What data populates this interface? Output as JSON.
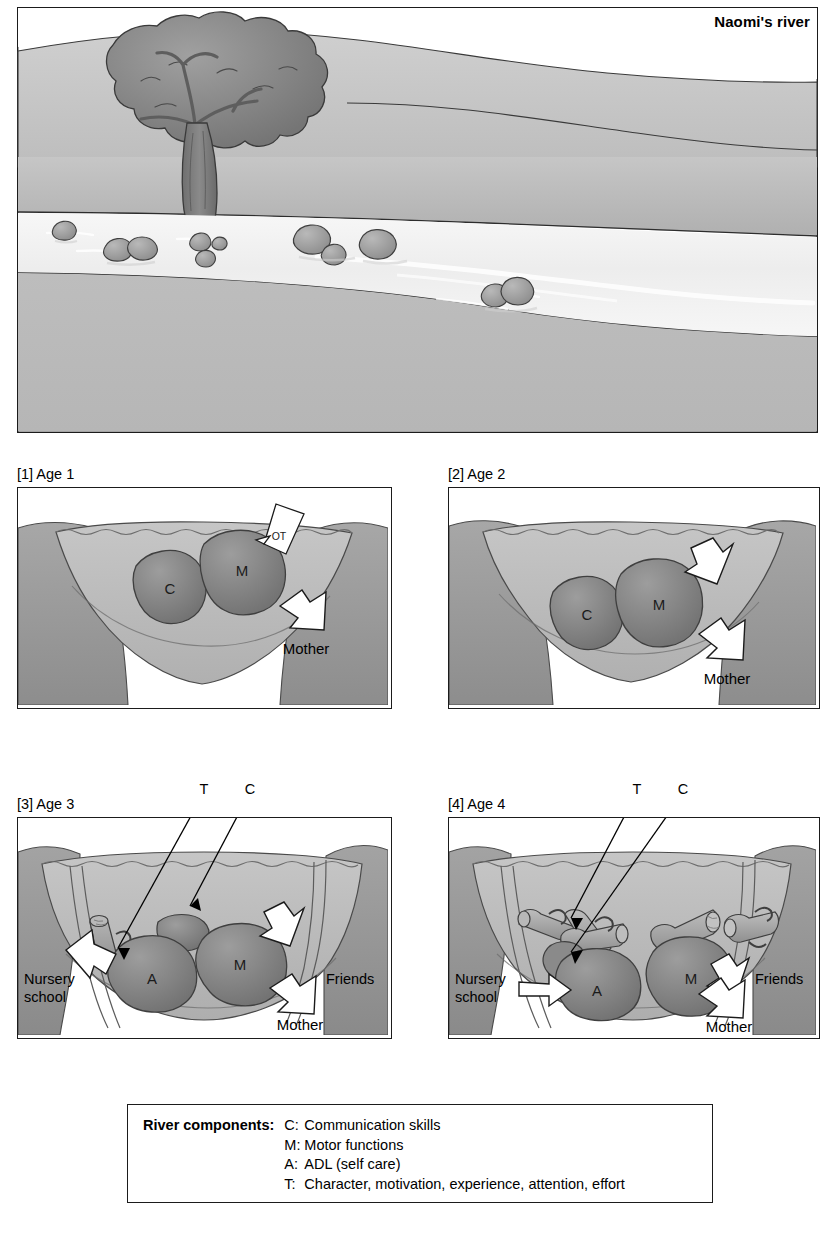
{
  "figure": {
    "title": "Naomi's river",
    "scene_elements": [
      "tree-icon",
      "riverbank",
      "river-water",
      "rocks"
    ]
  },
  "panels": [
    {
      "id": "panel-1",
      "caption": "[1] Age 1",
      "stones": [
        {
          "label": "C",
          "name": "stone-communication"
        },
        {
          "label": "M",
          "name": "stone-motor"
        }
      ],
      "arrows": [
        {
          "label": "OT",
          "name": "arrow-ot",
          "direction": "down-left"
        },
        {
          "label": "Mother",
          "name": "arrow-mother",
          "direction": "down-right"
        }
      ],
      "side_labels": []
    },
    {
      "id": "panel-2",
      "caption": "[2] Age 2",
      "stones": [
        {
          "label": "C",
          "name": "stone-communication"
        },
        {
          "label": "M",
          "name": "stone-motor"
        }
      ],
      "arrows": [
        {
          "label": "",
          "name": "arrow-unlabeled-motor",
          "direction": "down-left"
        },
        {
          "label": "Mother",
          "name": "arrow-mother",
          "direction": "down-right"
        }
      ],
      "side_labels": []
    },
    {
      "id": "panel-3",
      "caption": "[3] Age 3",
      "stones": [
        {
          "label": "A",
          "name": "stone-adl"
        },
        {
          "label": "M",
          "name": "stone-motor"
        },
        {
          "label": "",
          "name": "stone-communication-small"
        }
      ],
      "arrows": [
        {
          "label": "",
          "name": "arrow-unlabeled-motor",
          "direction": "down-left"
        },
        {
          "label": "Mother",
          "name": "arrow-mother",
          "direction": "down-right"
        },
        {
          "label": "",
          "name": "arrow-nursery-school",
          "direction": "up-right"
        }
      ],
      "callouts": [
        {
          "label": "T",
          "name": "callout-t"
        },
        {
          "label": "C",
          "name": "callout-c"
        }
      ],
      "side_labels": [
        {
          "label": "Nursery\nschool",
          "line1": "Nursery",
          "line2": "school",
          "name": "label-nursery-school"
        },
        {
          "label": "Friends",
          "name": "label-friends"
        }
      ]
    },
    {
      "id": "panel-4",
      "caption": "[4] Age 4",
      "stones": [
        {
          "label": "A",
          "name": "stone-adl"
        },
        {
          "label": "M",
          "name": "stone-motor"
        },
        {
          "label": "",
          "name": "stone-communication-small"
        }
      ],
      "arrows": [
        {
          "label": "",
          "name": "arrow-unlabeled-motor",
          "direction": "down-left"
        },
        {
          "label": "Mother",
          "name": "arrow-mother",
          "direction": "down-right"
        },
        {
          "label": "",
          "name": "arrow-nursery-school",
          "direction": "right"
        }
      ],
      "callouts": [
        {
          "label": "T",
          "name": "callout-t"
        },
        {
          "label": "C",
          "name": "callout-c"
        }
      ],
      "side_labels": [
        {
          "label": "Nursery\nschool",
          "line1": "Nursery",
          "line2": "school",
          "name": "label-nursery-school"
        },
        {
          "label": "Friends",
          "name": "label-friends"
        }
      ]
    }
  ],
  "legend": {
    "heading": "River components:",
    "items": [
      {
        "key": "C:",
        "desc": "Communication skills"
      },
      {
        "key": "M:",
        "desc": "Motor functions"
      },
      {
        "key": "A:",
        "desc": "ADL (self care)"
      },
      {
        "key": "T:",
        "desc": "Character, motivation, experience, attention, effort"
      }
    ]
  },
  "colors": {
    "outline": "#1b1b1b",
    "sky": "#ffffff",
    "bank_light": "#c9c9c9",
    "bank_mid": "#b4b4b4",
    "bank_dark": "#9a9a9a",
    "water": "#f2f2f2",
    "stone": "#8e8e8e",
    "stone_dark": "#7a7a7a",
    "log": "#a8a8a8",
    "arrow_fill": "#ffffff",
    "text": "#000000"
  }
}
